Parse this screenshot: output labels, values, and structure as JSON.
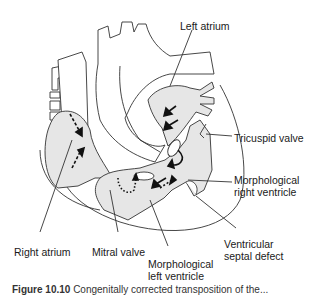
{
  "diagram": {
    "labels": {
      "left_atrium": "Left atrium",
      "tricuspid_valve": "Tricuspid valve",
      "morph_right_ventricle_1": "Morphological",
      "morph_right_ventricle_2": "right ventricle",
      "right_atrium": "Right atrium",
      "mitral_valve": "Mitral valve",
      "morph_left_ventricle_1": "Morphological",
      "morph_left_ventricle_2": "left ventricle",
      "vsd_1": "Ventricular",
      "vsd_2": "septal defect"
    },
    "colors": {
      "chamber_fill": "#e6e6e6",
      "outline": "#333333",
      "arrow": "#111111"
    }
  },
  "caption": {
    "prefix": "Figure 10.10",
    "text": "Congenitally corrected transposition of the..."
  }
}
